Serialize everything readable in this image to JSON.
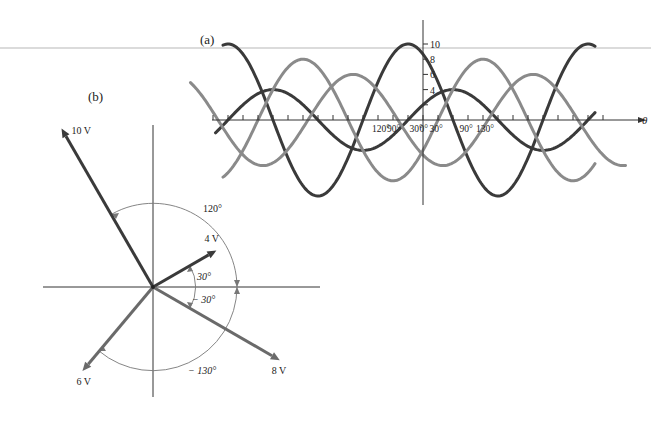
{
  "panel_a": {
    "label": "(a)",
    "x_axis_label": "θ",
    "y_tick_labels": [
      "10",
      "8",
      "6",
      "4"
    ],
    "x_tick_labels": [
      {
        "text": "120°",
        "deg": -90
      },
      {
        "text": "90°",
        "deg": -60
      },
      {
        "text": "30°",
        "deg": -15
      },
      {
        "text": "0°",
        "deg": 5
      },
      {
        "text": "30°",
        "deg": 25
      },
      {
        "text": "90°",
        "deg": 85
      },
      {
        "text": "130°",
        "deg": 118
      }
    ],
    "colors": {
      "dark": "#3a3a3a",
      "light": "#8a8a8a",
      "axis": "#333333",
      "ruler": "#c8c8c8"
    }
  },
  "panel_b": {
    "label": "(b)",
    "phasors": [
      {
        "label": "10 V",
        "magnitude": 10,
        "angle_deg": 120,
        "color": "#3a3a3a"
      },
      {
        "label": "4 V",
        "magnitude": 4,
        "angle_deg": 30,
        "color": "#3a3a3a"
      },
      {
        "label": "8 V",
        "magnitude": 8,
        "angle_deg": -30,
        "color": "#6a6a6a"
      },
      {
        "label": "6 V",
        "magnitude": 6,
        "angle_deg": -130,
        "color": "#6a6a6a"
      }
    ],
    "angle_labels": [
      "120°",
      "30°",
      "− 30°",
      "− 130°"
    ]
  },
  "chart_data": {
    "type": "line",
    "title": "",
    "xlabel": "θ",
    "ylabel": "",
    "series": [
      {
        "name": "10 sin(θ + 120°)",
        "amplitude": 10,
        "phase_deg": 120,
        "shade": "dark"
      },
      {
        "name": "4 sin(θ + 30°)",
        "amplitude": 4,
        "phase_deg": 30,
        "shade": "dark"
      },
      {
        "name": "8 sin(θ − 30°)",
        "amplitude": 8,
        "phase_deg": -30,
        "shade": "light"
      },
      {
        "name": "6 sin(θ − 130°)",
        "amplitude": 6,
        "phase_deg": -130,
        "shade": "light"
      }
    ],
    "y_ticks": [
      4,
      6,
      8,
      10
    ],
    "x_tick_labels": [
      "120°",
      "90°",
      "30°",
      "0°",
      "30°",
      "90°",
      "130°"
    ],
    "grid": false,
    "legend": "none"
  }
}
